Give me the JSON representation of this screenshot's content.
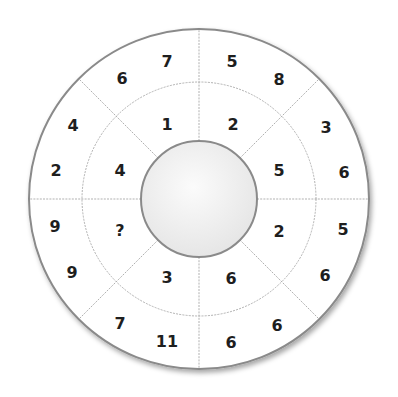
{
  "puzzle": {
    "type": "number-wheel",
    "sectors": 8,
    "rings": [
      "inner",
      "outer"
    ],
    "missing_symbol": "?",
    "colors": {
      "background": "#ffffff",
      "outer_stroke": "#8a8a8a",
      "divider": "#a0a0a0",
      "hub_fill": "#f0f0f0",
      "text": "#1e1e1e"
    },
    "numbers": {
      "top_left_outer_a": "6",
      "top_left_outer_b": "7",
      "top_left_inner": "1",
      "top_right_outer_a": "5",
      "top_right_outer_b": "8",
      "top_right_inner": "2",
      "right_upper_outer_a": "3",
      "right_upper_outer_b": "6",
      "right_upper_inner": "5",
      "right_lower_outer_a": "5",
      "right_lower_outer_b": "6",
      "right_lower_inner": "2",
      "bottom_right_outer_a": "6",
      "bottom_right_outer_b": "6",
      "bottom_right_inner": "6",
      "bottom_left_outer_a": "7",
      "bottom_left_outer_b": "11",
      "bottom_left_inner": "3",
      "left_lower_outer_a": "9",
      "left_lower_outer_b": "9",
      "left_lower_inner": "?",
      "left_upper_outer_a": "4",
      "left_upper_outer_b": "2",
      "left_upper_inner": "4"
    }
  }
}
